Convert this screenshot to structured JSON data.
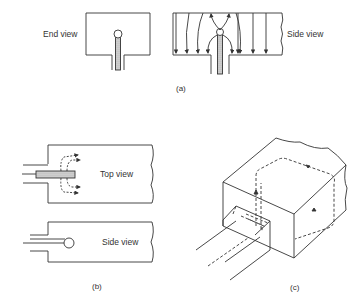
{
  "figure_a": {
    "end_view_label": "End view",
    "side_view_label": "Side view",
    "caption": "(a)"
  },
  "figure_b": {
    "top_view_label": "Top view",
    "side_view_label": "Side view",
    "caption": "(b)"
  },
  "figure_c": {
    "caption": "(c)"
  },
  "colors": {
    "line": "#333333",
    "background": "#ffffff",
    "hatch": "#888888"
  }
}
